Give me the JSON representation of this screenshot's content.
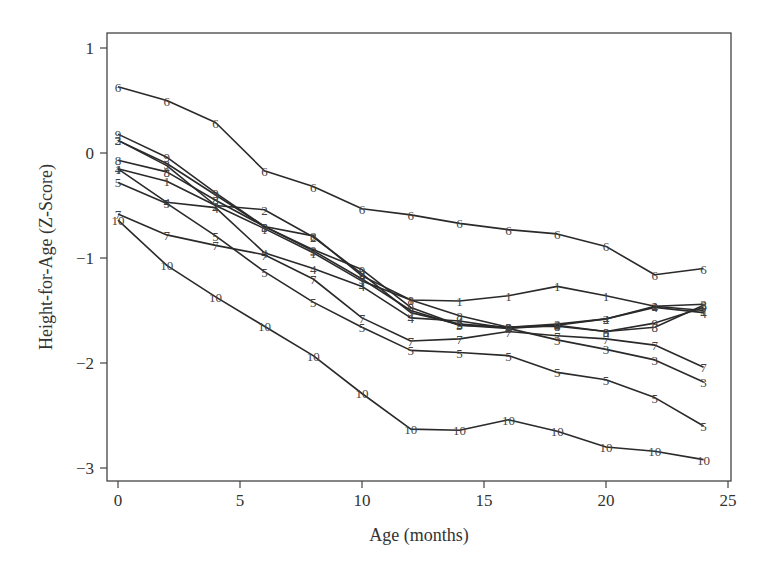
{
  "chart_data": {
    "type": "line",
    "title": "",
    "xlabel": "Age (months)",
    "ylabel": "Height-for-Age (Z-Score)",
    "xlim": [
      -0.5,
      25.5
    ],
    "ylim": [
      -3.1,
      1.15
    ],
    "xticks": [
      0,
      5,
      10,
      15,
      20,
      25
    ],
    "yticks": [
      1,
      0,
      -1,
      -2,
      -3
    ],
    "ytick_labels": [
      "1",
      "0",
      "−1",
      "−2",
      "−3"
    ],
    "grid": false,
    "legend": "none (series identified by numeric markers 1-10)",
    "x": [
      0,
      2,
      4,
      6,
      8,
      10,
      12,
      14,
      16,
      18,
      20,
      22,
      24
    ],
    "series": [
      {
        "name": "1",
        "values": [
          -0.15,
          -0.27,
          -0.5,
          -0.72,
          -0.95,
          -1.22,
          -1.4,
          -1.41,
          -1.36,
          -1.27,
          -1.36,
          -1.46,
          -1.5
        ]
      },
      {
        "name": "2",
        "values": [
          0.12,
          -0.12,
          -0.5,
          -0.54,
          -0.8,
          -1.15,
          -1.52,
          -1.63,
          -1.66,
          -1.63,
          -1.58,
          -1.46,
          -1.44
        ]
      },
      {
        "name": "3",
        "values": [
          0.12,
          -0.1,
          -0.4,
          -0.7,
          -0.93,
          -1.2,
          -1.5,
          -1.64,
          -1.67,
          -1.78,
          -1.87,
          -1.97,
          -2.18
        ]
      },
      {
        "name": "4",
        "values": [
          -0.15,
          -0.47,
          -0.52,
          -0.95,
          -1.1,
          -1.27,
          -1.57,
          -1.6,
          -1.67,
          -1.64,
          -1.58,
          -1.47,
          -1.52
        ]
      },
      {
        "name": "5",
        "values": [
          -0.28,
          -0.48,
          -0.79,
          -1.13,
          -1.42,
          -1.66,
          -1.88,
          -1.9,
          -1.93,
          -2.09,
          -2.16,
          -2.33,
          -2.6
        ]
      },
      {
        "name": "6",
        "values": [
          0.63,
          0.5,
          0.29,
          -0.17,
          -0.32,
          -0.53,
          -0.59,
          -0.67,
          -0.73,
          -0.77,
          -0.89,
          -1.16,
          -1.1
        ]
      },
      {
        "name": "7",
        "values": [
          -0.58,
          -0.78,
          -0.88,
          -0.97,
          -1.2,
          -1.57,
          -1.79,
          -1.77,
          -1.7,
          -1.74,
          -1.77,
          -1.83,
          -2.04
        ]
      },
      {
        "name": "8",
        "values": [
          -0.07,
          -0.18,
          -0.45,
          -0.7,
          -0.79,
          -1.17,
          -1.4,
          -1.55,
          -1.66,
          -1.65,
          -1.7,
          -1.66,
          -1.45
        ]
      },
      {
        "name": "9",
        "values": [
          0.18,
          -0.04,
          -0.38,
          -0.7,
          -0.92,
          -1.11,
          -1.47,
          -1.64,
          -1.66,
          -1.64,
          -1.7,
          -1.62,
          -1.47
        ]
      },
      {
        "name": "10",
        "values": [
          -0.64,
          -1.07,
          -1.37,
          -1.65,
          -1.93,
          -2.29,
          -2.63,
          -2.64,
          -2.54,
          -2.65,
          -2.8,
          -2.84,
          -2.92
        ]
      }
    ]
  },
  "style": {
    "line_color": "#2a2a2a",
    "axis_color": "#444444",
    "text_color": "#333333",
    "background": "#ffffff"
  }
}
